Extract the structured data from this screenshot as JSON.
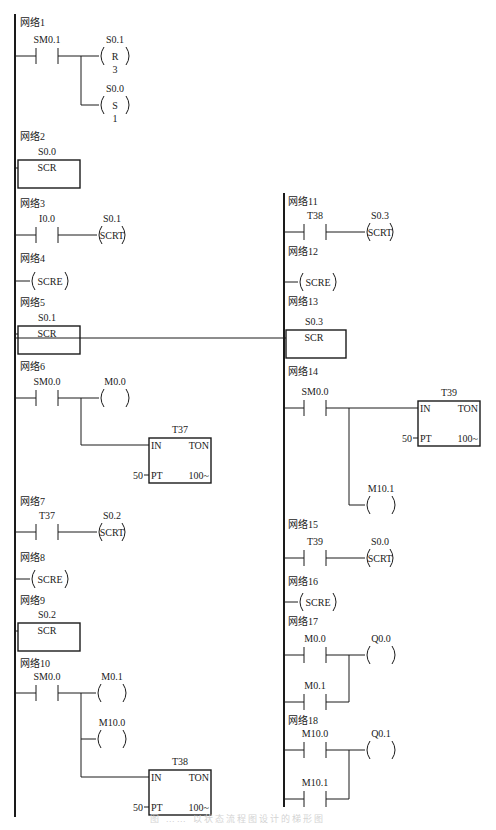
{
  "diagram": {
    "type": "PLC ladder diagram (sequential control relay / SCR)",
    "colors": {
      "line": "#1a1a1a",
      "background": "#ffffff",
      "caption": "#d4d4d4"
    },
    "rails": [
      {
        "x": 15,
        "y1": 14,
        "y2": 817
      },
      {
        "x": 284,
        "y1": 193,
        "y2": 807
      }
    ],
    "caption": "图 …… 以状态流程图设计的梯形图",
    "networks": [
      {
        "id": 1,
        "label": "网络1",
        "x": 20,
        "y": 26,
        "elements": [
          {
            "kind": "contact",
            "name": "SM0.1",
            "x": 36,
            "y": 56
          },
          {
            "kind": "coil",
            "name": "S0.1",
            "op": "R",
            "count": "3",
            "x": 99,
            "y": 56
          },
          {
            "kind": "coil",
            "name": "S0.0",
            "op": "S",
            "count": "1",
            "x": 99,
            "y": 105
          }
        ],
        "wires": [
          [
            15,
            56,
            36
          ],
          [
            58,
            56,
            99
          ],
          [
            81,
            56,
            81,
            105
          ],
          [
            81,
            105,
            99
          ]
        ]
      },
      {
        "id": 2,
        "label": "网络2",
        "x": 20,
        "y": 140,
        "elements": [
          {
            "kind": "scr",
            "name": "S0.0",
            "label": "SCR",
            "x": 18,
            "y": 160,
            "w": 62,
            "h": 28
          }
        ]
      },
      {
        "id": 3,
        "label": "网络3",
        "x": 20,
        "y": 207,
        "elements": [
          {
            "kind": "contact",
            "name": "I0.0",
            "x": 36,
            "y": 235
          },
          {
            "kind": "coil",
            "name": "S0.1",
            "op": "SCRT",
            "x": 97,
            "y": 235
          }
        ],
        "wires": [
          [
            15,
            235,
            36
          ],
          [
            58,
            235,
            97
          ]
        ]
      },
      {
        "id": 4,
        "label": "网络4",
        "x": 20,
        "y": 262,
        "elements": [
          {
            "kind": "scre",
            "label": "SCRE",
            "x": 30,
            "y": 281
          }
        ],
        "wires": [
          [
            15,
            281,
            30
          ]
        ]
      },
      {
        "id": 5,
        "label": "网络5",
        "x": 20,
        "y": 306,
        "elements": [
          {
            "kind": "scr",
            "name": "S0.1",
            "label": "SCR",
            "x": 18,
            "y": 326,
            "w": 62,
            "h": 28
          }
        ]
      },
      {
        "id": 6,
        "label": "网络6",
        "x": 20,
        "y": 370,
        "elements": [
          {
            "kind": "contact",
            "name": "SM0.0",
            "x": 36,
            "y": 398
          },
          {
            "kind": "coil",
            "name": "M0.0",
            "x": 99,
            "y": 398
          },
          {
            "kind": "timer",
            "name": "T37",
            "type": "TON",
            "in": "IN",
            "pt": "PT",
            "preset": "50",
            "base": "100~",
            "x": 149,
            "y": 438,
            "w": 62,
            "h": 45
          }
        ],
        "wires": [
          [
            15,
            398,
            36
          ],
          [
            58,
            398,
            99
          ],
          [
            81,
            398,
            81,
            445
          ],
          [
            81,
            445,
            149
          ]
        ]
      },
      {
        "id": 7,
        "label": "网络7",
        "x": 20,
        "y": 505,
        "elements": [
          {
            "kind": "contact",
            "name": "T37",
            "x": 36,
            "y": 532
          },
          {
            "kind": "coil",
            "name": "S0.2",
            "op": "SCRT",
            "x": 97,
            "y": 532
          }
        ],
        "wires": [
          [
            15,
            532,
            36
          ],
          [
            58,
            532,
            97
          ]
        ]
      },
      {
        "id": 8,
        "label": "网络8",
        "x": 20,
        "y": 561,
        "elements": [
          {
            "kind": "scre",
            "label": "SCRE",
            "x": 30,
            "y": 579
          }
        ],
        "wires": [
          [
            15,
            579,
            30
          ]
        ]
      },
      {
        "id": 9,
        "label": "网络9",
        "x": 20,
        "y": 604,
        "elements": [
          {
            "kind": "scr",
            "name": "S0.2",
            "label": "SCR",
            "x": 18,
            "y": 623,
            "w": 62,
            "h": 28
          }
        ]
      },
      {
        "id": 10,
        "label": "网络10",
        "x": 20,
        "y": 667,
        "elements": [
          {
            "kind": "contact",
            "name": "SM0.0",
            "x": 36,
            "y": 693
          },
          {
            "kind": "coil",
            "name": "M0.1",
            "x": 96,
            "y": 693
          },
          {
            "kind": "coil",
            "name": "M10.0",
            "x": 96,
            "y": 739
          },
          {
            "kind": "timer",
            "name": "T38",
            "type": "TON",
            "in": "IN",
            "pt": "PT",
            "preset": "50",
            "base": "100~",
            "x": 149,
            "y": 770,
            "w": 62,
            "h": 45
          }
        ],
        "wires": [
          [
            15,
            693,
            36
          ],
          [
            58,
            693,
            96
          ],
          [
            81,
            693,
            81,
            777
          ],
          [
            81,
            739,
            96
          ],
          [
            81,
            777,
            149
          ]
        ]
      },
      {
        "id": 11,
        "label": "网络11",
        "x": 288,
        "y": 205,
        "elements": [
          {
            "kind": "contact",
            "name": "T38",
            "x": 304,
            "y": 232
          },
          {
            "kind": "coil",
            "name": "S0.3",
            "op": "SCRT",
            "x": 365,
            "y": 232
          }
        ],
        "wires": [
          [
            284,
            232,
            304
          ],
          [
            326,
            232,
            365
          ]
        ]
      },
      {
        "id": 12,
        "label": "网络12",
        "x": 288,
        "y": 255,
        "elements": [
          {
            "kind": "scre",
            "label": "SCRE",
            "x": 298,
            "y": 282
          }
        ],
        "wires": [
          [
            284,
            282,
            298
          ]
        ]
      },
      {
        "id": 13,
        "label": "网络13",
        "x": 288,
        "y": 305,
        "elements": [
          {
            "kind": "scr",
            "name": "S0.3",
            "label": "SCR",
            "x": 286,
            "y": 330,
            "w": 60,
            "h": 28
          }
        ]
      },
      {
        "id": 14,
        "label": "网络14",
        "x": 288,
        "y": 375,
        "elements": [
          {
            "kind": "contact",
            "name": "SM0.0",
            "x": 304,
            "y": 408
          },
          {
            "kind": "timer",
            "name": "T39",
            "type": "TON",
            "in": "IN",
            "pt": "PT",
            "preset": "50",
            "base": "100~",
            "x": 418,
            "y": 401,
            "w": 62,
            "h": 45
          },
          {
            "kind": "coil",
            "name": "M10.1",
            "x": 365,
            "y": 505
          }
        ],
        "wires": [
          [
            284,
            408,
            304
          ],
          [
            326,
            408,
            418
          ],
          [
            349,
            408,
            349,
            505
          ],
          [
            349,
            505,
            365
          ]
        ]
      },
      {
        "id": 15,
        "label": "网络15",
        "x": 288,
        "y": 528,
        "elements": [
          {
            "kind": "contact",
            "name": "T39",
            "x": 304,
            "y": 558
          },
          {
            "kind": "coil",
            "name": "S0.0",
            "op": "SCRT",
            "x": 365,
            "y": 558
          }
        ],
        "wires": [
          [
            284,
            558,
            304
          ],
          [
            326,
            558,
            365
          ]
        ]
      },
      {
        "id": 16,
        "label": "网络16",
        "x": 288,
        "y": 585,
        "elements": [
          {
            "kind": "scre",
            "label": "SCRE",
            "x": 298,
            "y": 602
          }
        ],
        "wires": [
          [
            284,
            602,
            298
          ]
        ]
      },
      {
        "id": 17,
        "label": "网络17",
        "x": 288,
        "y": 625,
        "elements": [
          {
            "kind": "contact",
            "name": "M0.0",
            "x": 304,
            "y": 655
          },
          {
            "kind": "coil",
            "name": "Q0.0",
            "x": 365,
            "y": 655
          },
          {
            "kind": "contact",
            "name": "M0.1",
            "x": 304,
            "y": 702
          }
        ],
        "wires": [
          [
            284,
            655,
            304
          ],
          [
            326,
            655,
            365
          ],
          [
            349,
            655,
            349,
            702
          ],
          [
            284,
            702,
            304
          ],
          [
            326,
            702,
            349
          ]
        ]
      },
      {
        "id": 18,
        "label": "网络18",
        "x": 288,
        "y": 724,
        "elements": [
          {
            "kind": "contact",
            "name": "M10.0",
            "x": 304,
            "y": 750
          },
          {
            "kind": "coil",
            "name": "Q0.1",
            "x": 365,
            "y": 750
          },
          {
            "kind": "contact",
            "name": "M10.1",
            "x": 304,
            "y": 799
          }
        ],
        "wires": [
          [
            284,
            750,
            304
          ],
          [
            326,
            750,
            365
          ],
          [
            349,
            750,
            349,
            799
          ],
          [
            284,
            799,
            304
          ],
          [
            326,
            799,
            349
          ]
        ]
      }
    ]
  }
}
